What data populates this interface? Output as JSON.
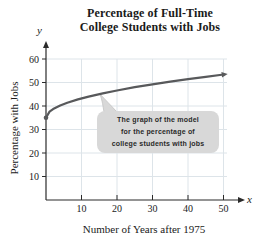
{
  "figure": {
    "title_lines": [
      "Percentage of Full-Time",
      "College Students with Jobs"
    ]
  },
  "chart_data": {
    "type": "line",
    "title": "Percentage of Full-Time College Students with Jobs",
    "xlabel": "Number of Years after 1975",
    "ylabel": "Percentage with Jobs",
    "x_axis_symbol": "x",
    "y_axis_symbol": "y",
    "x_ticks": [
      10,
      20,
      30,
      40,
      50
    ],
    "y_ticks": [
      10,
      20,
      30,
      40,
      50,
      60
    ],
    "xlim": [
      0,
      55
    ],
    "ylim": [
      0,
      65
    ],
    "grid": true,
    "legend": false,
    "series": [
      {
        "name": "model-curve",
        "description": "square-root-shaped model curve starting at (0,35) with a dot and ending near (50,53) with an arrowhead",
        "start_marker": "dot",
        "end_marker": "arrow",
        "points": [
          [
            0,
            35
          ],
          [
            1,
            37.6
          ],
          [
            2,
            38.7
          ],
          [
            4,
            40.2
          ],
          [
            6,
            41.4
          ],
          [
            9,
            42.8
          ],
          [
            12,
            44.0
          ],
          [
            16,
            45.4
          ],
          [
            20,
            46.6
          ],
          [
            25,
            48.0
          ],
          [
            30,
            49.2
          ],
          [
            35,
            50.4
          ],
          [
            40,
            51.4
          ],
          [
            45,
            52.4
          ],
          [
            49.5,
            53.3
          ]
        ]
      }
    ],
    "annotation": {
      "lines": [
        "The graph of the model",
        "for the percentage of",
        "college students with jobs"
      ]
    }
  },
  "colors": {
    "grid": "#dde4e9",
    "curve": "#58595b",
    "axis": "#2a2a2a",
    "text": "#1a1a1a",
    "callout_bg": "#d8d8d8",
    "callout_border": "#c2c2c2"
  }
}
